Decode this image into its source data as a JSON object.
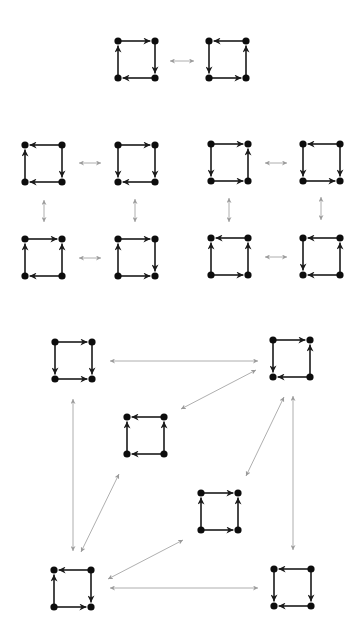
{
  "diagram": {
    "colors": {
      "edge": "#1a1a1a",
      "node": "#0d0d0d",
      "link": "#9a9a9a",
      "background": "#ffffff"
    },
    "square_size": 37,
    "squares": [
      {
        "id": "r1a",
        "section": "top",
        "x": 118,
        "y": 41,
        "top": "right",
        "right": "down",
        "bottom": "left",
        "left": "up"
      },
      {
        "id": "r1b",
        "section": "top",
        "x": 209,
        "y": 41,
        "top": "left",
        "right": "up",
        "bottom": "right",
        "left": "down"
      },
      {
        "id": "g1a",
        "section": "middle-left",
        "x": 25,
        "y": 145,
        "top": "left",
        "right": "down",
        "bottom": "left",
        "left": "up"
      },
      {
        "id": "g1b",
        "section": "middle-left",
        "x": 118,
        "y": 145,
        "top": "right",
        "right": "down",
        "bottom": "left",
        "left": "down"
      },
      {
        "id": "g1c",
        "section": "middle-left",
        "x": 25,
        "y": 239,
        "top": "right",
        "right": "up",
        "bottom": "left",
        "left": "up"
      },
      {
        "id": "g1d",
        "section": "middle-left",
        "x": 118,
        "y": 239,
        "top": "right",
        "right": "down",
        "bottom": "right",
        "left": "up"
      },
      {
        "id": "g2a",
        "section": "middle-right",
        "x": 211,
        "y": 144,
        "top": "right",
        "right": "up",
        "bottom": "right",
        "left": "down"
      },
      {
        "id": "g2b",
        "section": "middle-right",
        "x": 303,
        "y": 144,
        "top": "left",
        "right": "down",
        "bottom": "right",
        "left": "down"
      },
      {
        "id": "g2c",
        "section": "middle-right",
        "x": 211,
        "y": 238,
        "top": "left",
        "right": "up",
        "bottom": "right",
        "left": "up"
      },
      {
        "id": "g2d",
        "section": "middle-right",
        "x": 303,
        "y": 238,
        "top": "left",
        "right": "up",
        "bottom": "left",
        "left": "down"
      },
      {
        "id": "A",
        "section": "bottom",
        "x": 55,
        "y": 342,
        "top": "right",
        "right": "down",
        "bottom": "right",
        "left": "down"
      },
      {
        "id": "B",
        "section": "bottom",
        "x": 273,
        "y": 340,
        "top": "right",
        "right": "up",
        "bottom": "left",
        "left": "down"
      },
      {
        "id": "C",
        "section": "bottom",
        "x": 127,
        "y": 417,
        "top": "left",
        "right": "up",
        "bottom": "left",
        "left": "up"
      },
      {
        "id": "D",
        "section": "bottom",
        "x": 201,
        "y": 493,
        "top": "right",
        "right": "up",
        "bottom": "right",
        "left": "up"
      },
      {
        "id": "E",
        "section": "bottom",
        "x": 54,
        "y": 570,
        "top": "left",
        "right": "down",
        "bottom": "right",
        "left": "up"
      },
      {
        "id": "F",
        "section": "bottom",
        "x": 274,
        "y": 569,
        "top": "left",
        "right": "down",
        "bottom": "left",
        "left": "down"
      }
    ],
    "links": [
      {
        "from": "r1a",
        "to": "r1b",
        "x1": 170,
        "y1": 61,
        "x2": 194,
        "y2": 61
      },
      {
        "from": "g1a",
        "to": "g1b",
        "x1": 79,
        "y1": 163,
        "x2": 101,
        "y2": 163
      },
      {
        "from": "g1a",
        "to": "g1c",
        "x1": 44,
        "y1": 200,
        "x2": 44,
        "y2": 222
      },
      {
        "from": "g1b",
        "to": "g1d",
        "x1": 135,
        "y1": 199,
        "x2": 135,
        "y2": 222
      },
      {
        "from": "g1c",
        "to": "g1d",
        "x1": 79,
        "y1": 258,
        "x2": 101,
        "y2": 258
      },
      {
        "from": "g2a",
        "to": "g2b",
        "x1": 265,
        "y1": 163,
        "x2": 287,
        "y2": 163
      },
      {
        "from": "g2a",
        "to": "g2c",
        "x1": 229,
        "y1": 198,
        "x2": 229,
        "y2": 222
      },
      {
        "from": "g2b",
        "to": "g2d",
        "x1": 321,
        "y1": 197,
        "x2": 321,
        "y2": 220
      },
      {
        "from": "g2c",
        "to": "g2d",
        "x1": 265,
        "y1": 257,
        "x2": 287,
        "y2": 257
      },
      {
        "from": "A",
        "to": "B",
        "x1": 110,
        "y1": 361,
        "x2": 258,
        "y2": 361
      },
      {
        "from": "B",
        "to": "C",
        "x1": 256,
        "y1": 370,
        "x2": 181,
        "y2": 409
      },
      {
        "from": "A",
        "to": "E",
        "x1": 73,
        "y1": 399,
        "x2": 73,
        "y2": 551
      },
      {
        "from": "C",
        "to": "E",
        "x1": 119,
        "y1": 474,
        "x2": 81,
        "y2": 552
      },
      {
        "from": "B",
        "to": "D",
        "x1": 284,
        "y1": 397,
        "x2": 246,
        "y2": 476
      },
      {
        "from": "B",
        "to": "F",
        "x1": 293,
        "y1": 396,
        "x2": 293,
        "y2": 550
      },
      {
        "from": "D",
        "to": "E",
        "x1": 183,
        "y1": 540,
        "x2": 108,
        "y2": 579
      },
      {
        "from": "E",
        "to": "F",
        "x1": 110,
        "y1": 588,
        "x2": 258,
        "y2": 588
      }
    ]
  }
}
